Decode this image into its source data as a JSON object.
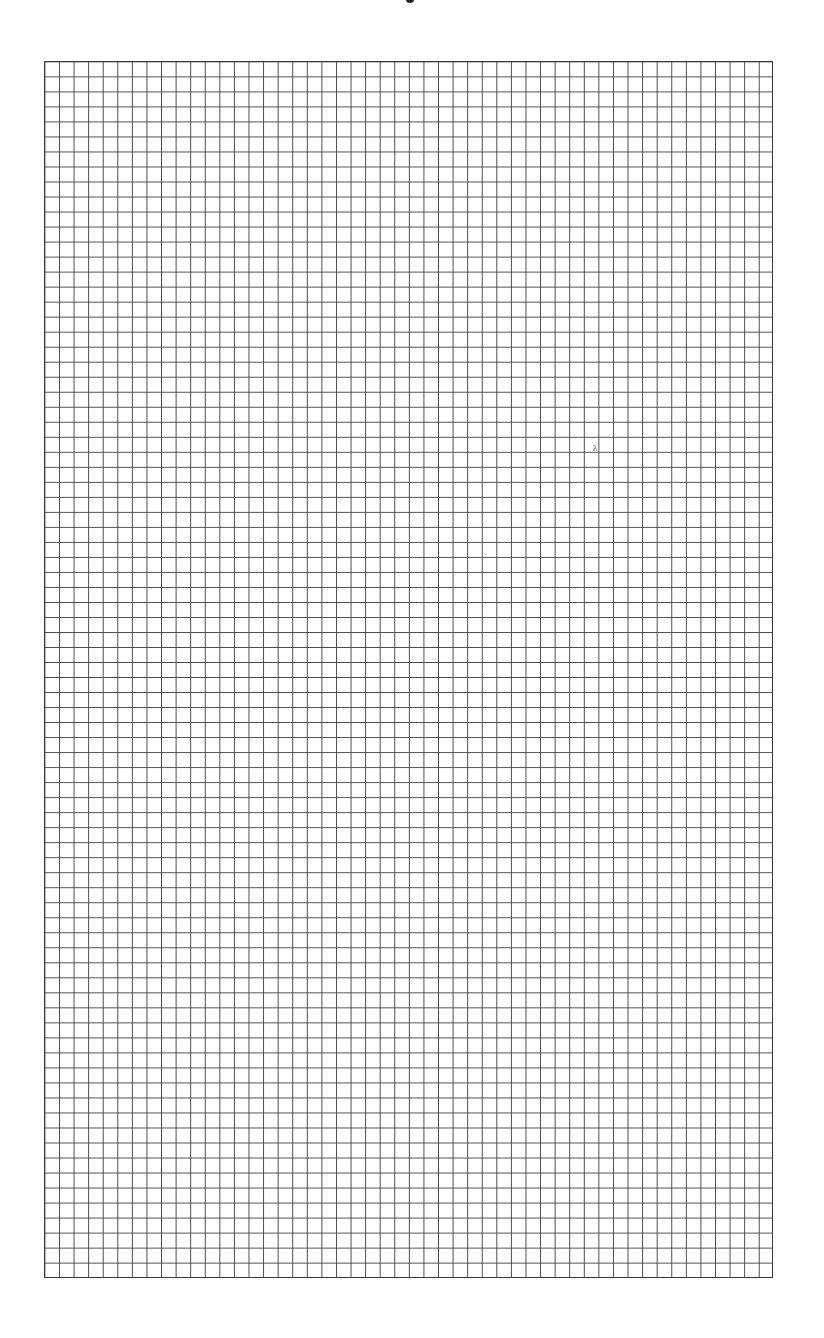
{
  "document": {
    "type": "graph-paper",
    "grid": {
      "columns": 50,
      "rows": 81,
      "line_color": "#4a4a4a",
      "background_color": "#ffffff"
    },
    "annotations": {
      "stray_mark": "λ"
    }
  }
}
